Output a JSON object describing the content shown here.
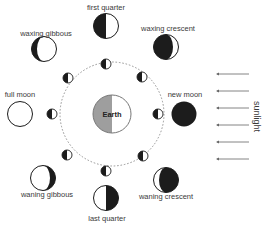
{
  "diagram": {
    "center": {
      "label": "Earth",
      "colors": {
        "dark_half": "#9e9e9e",
        "light_half": "#ffffff"
      }
    },
    "orbit": {
      "style": "dashed",
      "color": "#888888"
    },
    "light_source": {
      "label": "sunlight",
      "arrow_count": 6,
      "direction": "left"
    },
    "phases": [
      {
        "id": "first-quarter",
        "label": "first quarter"
      },
      {
        "id": "waxing-crescent",
        "label": "waxing crescent"
      },
      {
        "id": "new-moon",
        "label": "new moon"
      },
      {
        "id": "waning-crescent",
        "label": "waning crescent"
      },
      {
        "id": "last-quarter",
        "label": "last quarter"
      },
      {
        "id": "waning-gibbous",
        "label": "waning gibbous"
      },
      {
        "id": "full-moon",
        "label": "full moon"
      },
      {
        "id": "waxing-gibbous",
        "label": "waxing gibbous"
      }
    ],
    "colors": {
      "dark": "#1c1c1c",
      "light": "#ffffff",
      "outline": "#1c1c1c"
    }
  }
}
